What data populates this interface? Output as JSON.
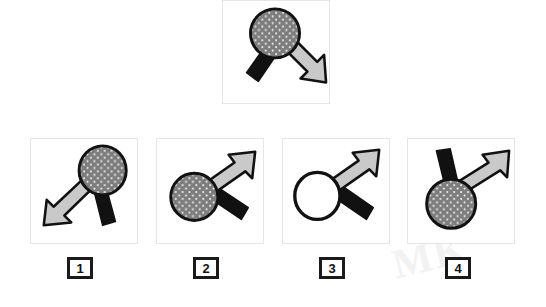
{
  "puzzle": {
    "type": "visual-analogy-mental-rotation",
    "prompt_panel": {
      "name": "prompt",
      "shape": "magnifier-with-arrow",
      "circle_fill": "stippled-gray",
      "black_bar_direction": "lower-left",
      "arrow_direction": "lower-right"
    },
    "options": [
      {
        "number": "1",
        "circle_fill": "stippled-gray",
        "black_bar_direction": "lower-right",
        "arrow_direction": "lower-left"
      },
      {
        "number": "2",
        "circle_fill": "stippled-gray",
        "black_bar_direction": "lower-right",
        "arrow_direction": "upper-right"
      },
      {
        "number": "3",
        "circle_fill": "white",
        "black_bar_direction": "lower-right",
        "arrow_direction": "upper-right"
      },
      {
        "number": "4",
        "circle_fill": "stippled-gray",
        "black_bar_direction": "upper-left",
        "arrow_direction": "upper-right"
      }
    ]
  },
  "colors": {
    "panel_border": "#e6e6e6",
    "outline": "#111111",
    "arrow_fill": "#c9c9c9",
    "bar_fill": "#111111",
    "circle_fill_gray": "#7d7d7d",
    "circle_fill_white": "#ffffff",
    "label_border": "#1a1a1a",
    "page_background": "#ffffff",
    "watermark": "#f2f2f2"
  },
  "watermark": {
    "text": "MK"
  }
}
